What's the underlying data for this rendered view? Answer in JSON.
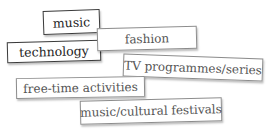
{
  "cards": [
    {
      "id": "music",
      "label": "music",
      "style": "dark"
    },
    {
      "id": "fashion",
      "label": "fashion",
      "style": "light"
    },
    {
      "id": "technology",
      "label": "technology",
      "style": "dark"
    },
    {
      "id": "tv",
      "label": "TV programmes/series",
      "style": "light"
    },
    {
      "id": "free-time",
      "label": "free-time activities",
      "style": "light"
    },
    {
      "id": "festivals",
      "label": "music/cultural festivals",
      "style": "light"
    }
  ],
  "colors": {
    "dark_border": "#3a3a3a",
    "light_border": "#8c8c8c",
    "dark_text": "#1e1e1e",
    "light_text": "#555555",
    "background": "#ffffff"
  }
}
